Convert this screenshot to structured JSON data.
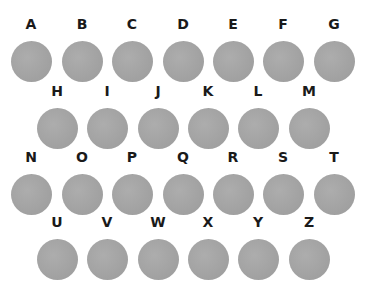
{
  "rows": [
    {
      "letters": [
        "A",
        "B",
        "C",
        "D",
        "E",
        "F",
        "G"
      ],
      "x": [
        31,
        82,
        132,
        183,
        233,
        283,
        334
      ],
      "y": 16
    },
    {
      "letters": [
        "H",
        "I",
        "J",
        "K",
        "L",
        "M"
      ],
      "x": [
        57,
        107,
        158,
        208,
        258,
        309
      ],
      "y": 83
    },
    {
      "letters": [
        "N",
        "O",
        "P",
        "Q",
        "R",
        "S",
        "T"
      ],
      "x": [
        31,
        82,
        132,
        183,
        233,
        283,
        334
      ],
      "y": 149
    },
    {
      "letters": [
        "U",
        "V",
        "W",
        "X",
        "Y",
        "Z"
      ],
      "x": [
        57,
        107,
        158,
        208,
        258,
        309
      ],
      "y": 214
    }
  ],
  "colors": {
    "circle": "#a3a3a3",
    "letter": "#1a1a1a",
    "background": "#ffffff"
  }
}
